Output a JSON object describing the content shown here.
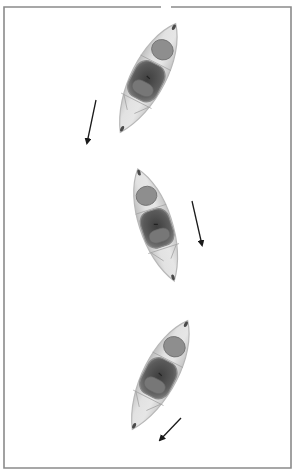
{
  "canvas": {
    "width": 295,
    "height": 473,
    "background": "#ffffff"
  },
  "frame": {
    "x": 4,
    "y": 7,
    "width": 287,
    "height": 461,
    "stroke": "#8a8a8a",
    "stroke_width": 1.6,
    "top_gap": {
      "x1": 161,
      "x2": 171
    }
  },
  "colors": {
    "hull": "#dcdcdc",
    "hull_edge": "#b8b8b8",
    "hatch": "#8e8e8e",
    "cockpit": "#5e5e5e",
    "cockpit_inner": "#454545",
    "seat": "#777777",
    "rim": "#a0a0a0",
    "arrow": "#1a1a1a"
  },
  "kayaks": [
    {
      "name": "kayak-1",
      "cx": 148,
      "cy": 78,
      "length": 122,
      "width": 40,
      "angle": 27
    },
    {
      "name": "kayak-2",
      "cx": 156,
      "cy": 225,
      "length": 118,
      "width": 38,
      "angle": -18
    },
    {
      "name": "kayak-3",
      "cx": 160,
      "cy": 375,
      "length": 122,
      "width": 40,
      "angle": 27
    }
  ],
  "arrows": [
    {
      "name": "arrow-1",
      "x1": 96,
      "y1": 100,
      "x2": 87,
      "y2": 143
    },
    {
      "name": "arrow-2",
      "x1": 192,
      "y1": 201,
      "x2": 202,
      "y2": 245
    },
    {
      "name": "arrow-3",
      "x1": 181,
      "y1": 418,
      "x2": 160,
      "y2": 440
    }
  ]
}
